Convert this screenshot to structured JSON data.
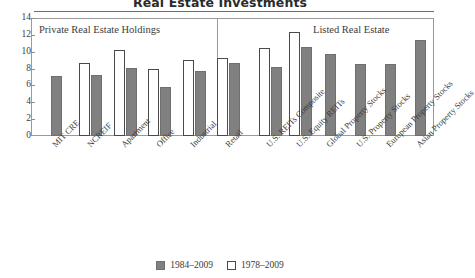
{
  "chart_data": {
    "type": "bar",
    "title": "Real Estate Investments",
    "xlabel": "",
    "ylabel": "",
    "ylim": [
      0,
      14
    ],
    "yticks": [
      0,
      2,
      4,
      6,
      8,
      10,
      12,
      14
    ],
    "grid": false,
    "legend_position": "bottom-center",
    "panels": [
      {
        "id": "private",
        "caption": "Private Real Estate Holdings"
      },
      {
        "id": "listed",
        "caption": "Listed Real Estate"
      }
    ],
    "categories": [
      "MIT CRE",
      "NCREIF",
      "Apartment",
      "Office",
      "Industrial",
      "Retail",
      "U.S. REITs Composite",
      "U.S. Equity REITs",
      "Global Property Stocks",
      "U.S. Property Stocks",
      "European Property Stocks",
      "Asian Property Stocks"
    ],
    "series": [
      {
        "name": "1978–2009",
        "style": "hollow",
        "color": "#ffffff",
        "values": [
          null,
          8.7,
          10.2,
          8.0,
          9.0,
          9.2,
          10.5,
          12.3,
          null,
          null,
          null,
          null
        ]
      },
      {
        "name": "1984–2009",
        "style": "filled",
        "color": "#808080",
        "values": [
          7.1,
          7.2,
          8.1,
          5.8,
          7.7,
          8.7,
          8.2,
          10.6,
          9.7,
          8.6,
          8.6,
          11.4
        ]
      }
    ]
  },
  "legend": {
    "entries": [
      {
        "label": "1984–2009",
        "style": "filled"
      },
      {
        "label": "1978–2009",
        "style": "hollow"
      }
    ]
  }
}
